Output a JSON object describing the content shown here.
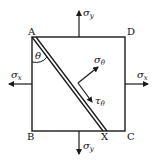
{
  "figure": {
    "vertices": {
      "A": "A",
      "B": "B",
      "C": "C",
      "D": "D",
      "X": "X"
    },
    "angle_label": "θ",
    "stresses": {
      "sigma_y_top": {
        "sym": "σ",
        "sub": "y"
      },
      "sigma_y_bottom": {
        "sym": "σ",
        "sub": "y"
      },
      "sigma_x_left": {
        "sym": "σ",
        "sub": "x"
      },
      "sigma_x_right": {
        "sym": "σ",
        "sub": "x"
      },
      "sigma_theta": {
        "sym": "σ",
        "sub": "θ"
      },
      "tau_theta": {
        "sym": "τ",
        "sub": "θ"
      }
    },
    "stroke_color": "#1a1a1a"
  }
}
